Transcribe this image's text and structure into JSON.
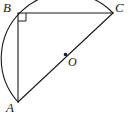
{
  "figure": {
    "type": "geometry-diagram",
    "background_color": "#ffffff",
    "stroke_color": "#1a1a1a",
    "labels": {
      "vertex_b": "B",
      "vertex_c": "C",
      "vertex_a": "A",
      "center_o": "O"
    },
    "points": {
      "B": {
        "x": 18,
        "y": 13
      },
      "C": {
        "x": 113,
        "y": 13
      },
      "A": {
        "x": 18,
        "y": 102
      },
      "O": {
        "x": 65.5,
        "y": 57.5
      }
    },
    "segments": [
      {
        "name": "BC",
        "from": "B",
        "to": "C"
      },
      {
        "name": "BA",
        "from": "B",
        "to": "A"
      },
      {
        "name": "AC",
        "from": "A",
        "to": "C"
      }
    ],
    "right_angle_marker": {
      "at": "B",
      "size": 8
    },
    "semicircle": {
      "center": "O",
      "diameter_endpoints": [
        "A",
        "C"
      ],
      "radius": 65.1,
      "bulge_toward": "B"
    },
    "center_dot": {
      "at": "O",
      "radius": 1.6
    }
  }
}
